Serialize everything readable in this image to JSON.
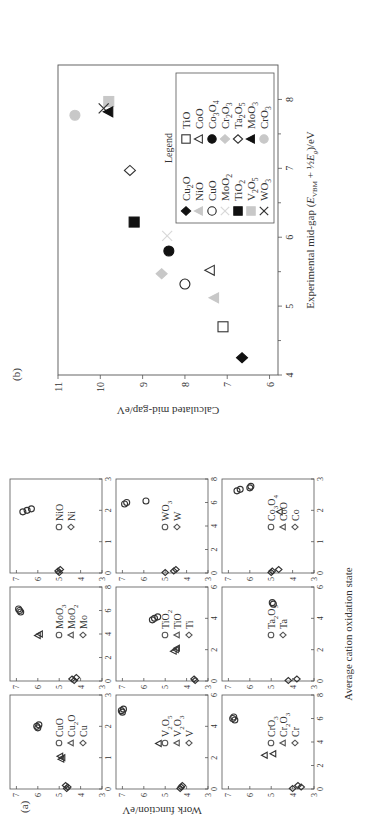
{
  "figure": {
    "panel_a_label": "(a)",
    "panel_b_label": "(b)"
  },
  "chart_data": [
    {
      "panel": "(a)",
      "type": "scatter",
      "layout": "3x3 grid of small multiples",
      "ylabel": "Work function/eV",
      "xlabel": "Average cation oxidation state",
      "ylim": [
        3,
        7.3
      ],
      "yticks": [
        3,
        4,
        5,
        6,
        7
      ],
      "subplots": [
        {
          "id": "Cu",
          "xlim": [
            0,
            3
          ],
          "xticks": [
            0,
            1,
            2,
            3
          ],
          "legend": [
            "CuO",
            "Cu2O",
            "Cu"
          ],
          "series": [
            {
              "name": "CuO",
              "marker": "circle",
              "x": [
                2,
                2,
                2
              ],
              "y": [
                6.0,
                6.05,
                5.95
              ]
            },
            {
              "name": "Cu2O",
              "marker": "triangle",
              "x": [
                1,
                1,
                1
              ],
              "y": [
                4.9,
                4.85,
                4.95
              ]
            },
            {
              "name": "Cu",
              "marker": "diamond",
              "x": [
                0,
                0,
                0
              ],
              "y": [
                4.65,
                4.6,
                4.7
              ]
            }
          ]
        },
        {
          "id": "Mo",
          "xlim": [
            0,
            8
          ],
          "xticks": [
            0,
            2,
            4,
            6,
            8
          ],
          "legend": [
            "MoO3",
            "MoO2",
            "Mo"
          ],
          "series": [
            {
              "name": "MoO3",
              "marker": "circle",
              "x": [
                6,
                6,
                6
              ],
              "y": [
                6.8,
                6.85,
                6.9
              ]
            },
            {
              "name": "MoO2",
              "marker": "triangle",
              "x": [
                4,
                4
              ],
              "y": [
                6.0,
                5.9
              ]
            },
            {
              "name": "Mo",
              "marker": "diamond",
              "x": [
                0,
                0,
                0
              ],
              "y": [
                4.3,
                4.4,
                4.2
              ]
            }
          ]
        },
        {
          "id": "Ni",
          "xlim": [
            0,
            3
          ],
          "xticks": [
            0,
            1,
            2,
            3
          ],
          "legend": [
            "NiO",
            "Ni"
          ],
          "series": [
            {
              "name": "NiO",
              "marker": "circle",
              "x": [
                2,
                2,
                2
              ],
              "y": [
                6.7,
                6.5,
                6.3
              ]
            },
            {
              "name": "Ni",
              "marker": "diamond",
              "x": [
                0,
                0,
                0
              ],
              "y": [
                5.0,
                5.05,
                4.95
              ]
            }
          ]
        },
        {
          "id": "V",
          "xlim": [
            0,
            6
          ],
          "xticks": [
            0,
            2,
            4,
            6
          ],
          "legend": [
            "V2O5",
            "V2O3",
            "V"
          ],
          "series": [
            {
              "name": "V2O5",
              "marker": "circle",
              "x": [
                5,
                5,
                5
              ],
              "y": [
                7.0,
                7.05,
                6.95
              ]
            },
            {
              "name": "V2O3",
              "marker": "triangle",
              "x": [
                3
              ],
              "y": [
                5.3
              ]
            },
            {
              "name": "V",
              "marker": "diamond",
              "x": [
                0,
                0,
                0
              ],
              "y": [
                4.3,
                4.25,
                4.2
              ]
            }
          ]
        },
        {
          "id": "Ti",
          "xlim": [
            0,
            6
          ],
          "xticks": [
            0,
            2,
            4,
            6
          ],
          "legend": [
            "TiO2",
            "TiO",
            "Ti"
          ],
          "series": [
            {
              "name": "TiO2",
              "marker": "circle",
              "x": [
                4,
                4,
                4
              ],
              "y": [
                5.6,
                5.5,
                5.35
              ]
            },
            {
              "name": "TiO",
              "marker": "triangle",
              "x": [
                2,
                2,
                2
              ],
              "y": [
                4.6,
                4.5,
                4.45
              ]
            },
            {
              "name": "Ti",
              "marker": "diamond",
              "x": [
                0,
                0
              ],
              "y": [
                3.6,
                3.65
              ]
            }
          ]
        },
        {
          "id": "W",
          "xlim": [
            0,
            8
          ],
          "xticks": [
            0,
            2,
            4,
            6,
            8
          ],
          "legend": [
            "WO3",
            "W"
          ],
          "series": [
            {
              "name": "WO3",
              "marker": "circle",
              "x": [
                6,
                6,
                6
              ],
              "y": [
                6.9,
                6.8,
                5.9
              ]
            },
            {
              "name": "W",
              "marker": "diamond",
              "x": [
                0,
                0,
                0
              ],
              "y": [
                5.0,
                4.6,
                4.5
              ]
            }
          ]
        },
        {
          "id": "Cr",
          "xlim": [
            0,
            8
          ],
          "xticks": [
            0,
            2,
            4,
            6,
            8
          ],
          "legend": [
            "CrO3",
            "Cr2O3",
            "Cr"
          ],
          "series": [
            {
              "name": "CrO3",
              "marker": "circle",
              "x": [
                6,
                6,
                6
              ],
              "y": [
                6.7,
                6.8,
                6.75
              ]
            },
            {
              "name": "Cr2O3",
              "marker": "triangle",
              "x": [
                3,
                3
              ],
              "y": [
                5.3,
                4.9
              ]
            },
            {
              "name": "Cr",
              "marker": "diamond",
              "x": [
                0,
                0,
                0
              ],
              "y": [
                4.0,
                3.6,
                3.75
              ]
            }
          ]
        },
        {
          "id": "Ta",
          "xlim": [
            0,
            6
          ],
          "xticks": [
            0,
            2,
            4,
            6
          ],
          "legend": [
            "Ta2O5",
            "Ta"
          ],
          "series": [
            {
              "name": "Ta2O5",
              "marker": "circle",
              "x": [
                5,
                5
              ],
              "y": [
                4.9,
                4.95
              ]
            },
            {
              "name": "Ta",
              "marker": "diamond",
              "x": [
                0,
                0
              ],
              "y": [
                4.2,
                3.8
              ]
            }
          ]
        },
        {
          "id": "Co",
          "xlim": [
            0,
            3
          ],
          "xticks": [
            0,
            1,
            2,
            3
          ],
          "legend": [
            "Co3O4",
            "CoO",
            "Co"
          ],
          "series": [
            {
              "name": "Co3O4",
              "marker": "circle",
              "x": [
                2.67,
                2.67,
                2.67,
                2.67
              ],
              "y": [
                6.6,
                6.45,
                6.0,
                5.95
              ]
            },
            {
              "name": "CoO",
              "marker": "triangle",
              "x": [
                2
              ],
              "y": [
                4.6
              ]
            },
            {
              "name": "Co",
              "marker": "diamond",
              "x": [
                0,
                0,
                0
              ],
              "y": [
                5.0,
                4.95,
                4.65
              ]
            }
          ]
        }
      ]
    },
    {
      "panel": "(b)",
      "type": "scatter",
      "xlabel": "Experimental mid-gap (E_VBM + ½E_g)/eV",
      "ylabel": "Calculated mid-gap/eV",
      "xlim": [
        4,
        8.5
      ],
      "ylim": [
        5.8,
        11
      ],
      "xticks": [
        4,
        5,
        6,
        7,
        8
      ],
      "yticks": [
        6,
        7,
        8,
        9,
        10,
        11
      ],
      "grid": false,
      "legend_title": "Legend",
      "legend_position": "lower right",
      "series": [
        {
          "name": "Cu2O",
          "marker": "diamond-filled",
          "color": "#111111",
          "x": 4.25,
          "y": 6.65
        },
        {
          "name": "NiO",
          "marker": "triangle-filled",
          "color": "#c8c8c8",
          "x": 5.12,
          "y": 7.3
        },
        {
          "name": "CuO",
          "marker": "circle-open",
          "color": "#222222",
          "x": 5.32,
          "y": 8.0
        },
        {
          "name": "MoO2",
          "marker": "x",
          "color": "#d8d8d8",
          "x": 6.02,
          "y": 8.42
        },
        {
          "name": "TiO2",
          "marker": "square-filled",
          "color": "#111111",
          "x": 6.22,
          "y": 9.2
        },
        {
          "name": "V2O5",
          "marker": "square-filled",
          "color": "#c8c8c8",
          "x": 7.97,
          "y": 9.8
        },
        {
          "name": "WO3",
          "marker": "x",
          "color": "#333333",
          "x": 7.87,
          "y": 9.92
        },
        {
          "name": "TiO",
          "marker": "square-open",
          "color": "#333333",
          "x": 4.7,
          "y": 7.1
        },
        {
          "name": "CoO",
          "marker": "triangle-open",
          "color": "#333333",
          "x": 5.52,
          "y": 7.4
        },
        {
          "name": "Co3O4",
          "marker": "circle-filled",
          "color": "#111111",
          "x": 5.8,
          "y": 8.38
        },
        {
          "name": "Cr2O3",
          "marker": "diamond-filled",
          "color": "#c8c8c8",
          "x": 5.47,
          "y": 8.55
        },
        {
          "name": "Ta2O5",
          "marker": "diamond-open",
          "color": "#333333",
          "x": 6.97,
          "y": 9.3
        },
        {
          "name": "MoO3",
          "marker": "triangle-filled",
          "color": "#111111",
          "x": 7.82,
          "y": 9.8
        },
        {
          "name": "CrO3",
          "marker": "circle-filled",
          "color": "#c8c8c8",
          "x": 7.77,
          "y": 10.6
        }
      ]
    }
  ]
}
